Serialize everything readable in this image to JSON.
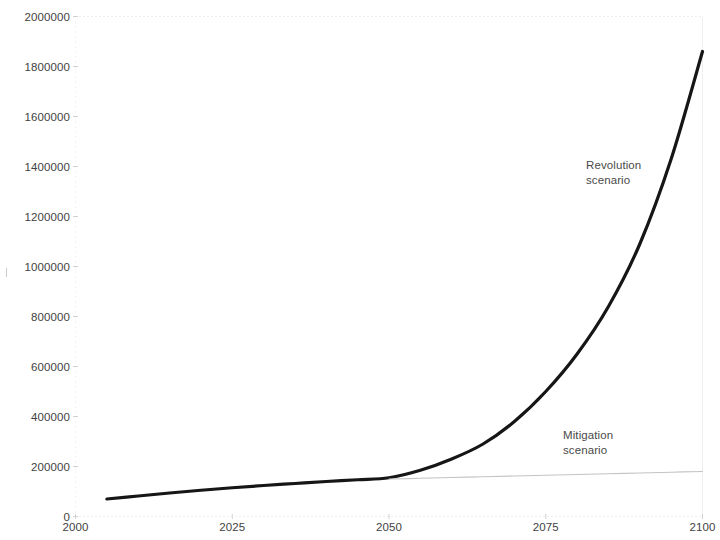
{
  "chart_data": {
    "type": "line",
    "title": "",
    "subtitle": "",
    "xlabel": "",
    "ylabel": "",
    "xlim": [
      2000,
      2100
    ],
    "ylim": [
      0,
      2000000
    ],
    "grid": false,
    "legend_position": "inline-annotations",
    "x_ticks": [
      "2000",
      "2025",
      "2050",
      "2075",
      "2100"
    ],
    "x_tick_values": [
      2000,
      2025,
      2050,
      2075,
      2100
    ],
    "y_ticks": [
      "0",
      "200000",
      "400000",
      "600000",
      "800000",
      "1000000",
      "1200000",
      "1400000",
      "1600000",
      "1800000",
      "2000000"
    ],
    "y_tick_values": [
      0,
      200000,
      400000,
      600000,
      800000,
      1000000,
      1200000,
      1400000,
      1600000,
      1800000,
      2000000
    ],
    "series": [
      {
        "name": "Revolution scenario",
        "color": "#161616",
        "width": 3.2,
        "x": [
          2005,
          2010,
          2015,
          2020,
          2025,
          2030,
          2035,
          2040,
          2045,
          2050,
          2055,
          2060,
          2065,
          2070,
          2075,
          2080,
          2085,
          2090,
          2095,
          2100
        ],
        "values": [
          70000,
          82000,
          94000,
          105000,
          115000,
          124000,
          132000,
          140000,
          147000,
          155000,
          185000,
          230000,
          290000,
          380000,
          500000,
          650000,
          840000,
          1090000,
          1430000,
          1860000
        ]
      },
      {
        "name": "Mitigation scenario",
        "color": "#c4c4c4",
        "width": 1.2,
        "x": [
          2050,
          2055,
          2060,
          2065,
          2070,
          2075,
          2080,
          2085,
          2090,
          2095,
          2100
        ],
        "values": [
          150000,
          153000,
          156000,
          159000,
          162000,
          165000,
          168000,
          171000,
          174000,
          177000,
          180000
        ]
      }
    ],
    "annotations": [
      {
        "text": "Revolution\nscenario",
        "x": 2080,
        "y": 1400000
      },
      {
        "text": "Mitigation\nscenario",
        "x": 2077,
        "y": 290000
      }
    ]
  },
  "axis_style": {
    "axis_color": "#d9d9d9",
    "tick_label_color": "#3f3f3f",
    "annotation_color": "#4a4a4a",
    "background": "#ffffff"
  }
}
